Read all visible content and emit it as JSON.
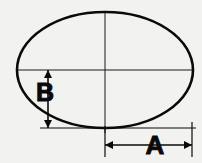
{
  "figure": {
    "kind": "engineering-dimension-drawing",
    "background_color": "#f2f2f0",
    "ink_color": "#0a0a0a"
  },
  "shape": {
    "name": "ellipse",
    "center_x": 105,
    "center_y": 70,
    "radius_x": 88,
    "radius_y": 58,
    "stroke_width": 2.6
  },
  "centerlines": {
    "horizontal": {
      "x1": 17,
      "y1": 70,
      "x2": 193,
      "y2": 70
    },
    "vertical": {
      "x1": 105,
      "y1": 11,
      "x2": 105,
      "y2": 133
    },
    "stroke_width": 1.0
  },
  "baseline": {
    "name": "bottom-extension-line",
    "x1": 40,
    "y1": 128,
    "x2": 196,
    "y2": 128,
    "stroke_width": 1.2
  },
  "dimensions": [
    {
      "id": "B",
      "label": "B",
      "orientation": "vertical",
      "line_x": 48,
      "y_start": 70,
      "y_end": 128,
      "label_x": 45,
      "label_y": 101,
      "font_size": 25,
      "arrowheads": "both-outward"
    },
    {
      "id": "A",
      "label": "A",
      "orientation": "horizontal",
      "line_y": 145,
      "x_start": 105,
      "x_end": 192,
      "label_x": 155,
      "label_y": 154,
      "font_size": 26,
      "arrowheads": "both-outward"
    }
  ],
  "extension_lines": [
    {
      "id": "a-left-extension",
      "x1": 105,
      "y1": 126,
      "x2": 105,
      "y2": 157
    },
    {
      "id": "a-right-extension",
      "x1": 192,
      "y1": 122,
      "x2": 192,
      "y2": 157
    }
  ]
}
